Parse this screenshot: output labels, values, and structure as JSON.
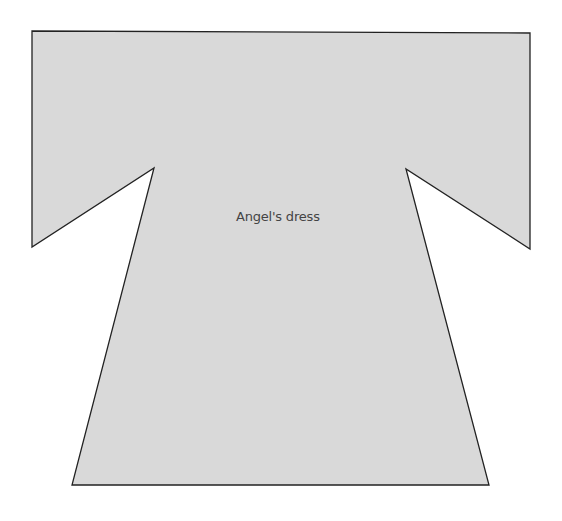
{
  "diagram": {
    "type": "sewing-pattern-piece",
    "piece_label": "Angel's dress",
    "fill_color": "#d9d9d9",
    "stroke_color": "#222222",
    "outline_points": [
      [
        32,
        31
      ],
      [
        530,
        33
      ],
      [
        530,
        249
      ],
      [
        406,
        169
      ],
      [
        489,
        485
      ],
      [
        72,
        485
      ],
      [
        154,
        168
      ],
      [
        32,
        247
      ]
    ]
  }
}
